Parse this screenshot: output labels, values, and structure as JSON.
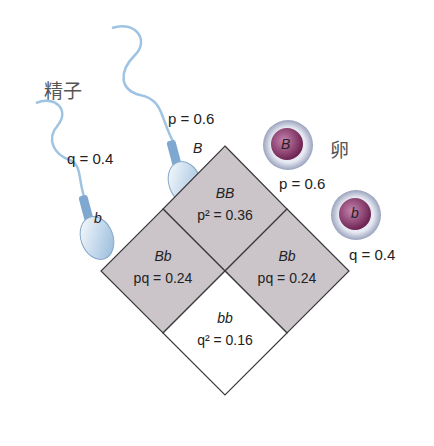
{
  "labels": {
    "sperm_title": "精子",
    "egg_title": "卵"
  },
  "sperm": [
    {
      "allele": "B",
      "freq_label": "p = 0.6"
    },
    {
      "allele": "b",
      "freq_label": "q = 0.4"
    }
  ],
  "eggs": [
    {
      "allele": "B",
      "freq_label": "p = 0.6"
    },
    {
      "allele": "b",
      "freq_label": "q = 0.4"
    }
  ],
  "punnett": {
    "top": {
      "genotype": "BB",
      "freq": "p² = 0.36"
    },
    "left": {
      "genotype": "Bb",
      "freq": "pq = 0.24"
    },
    "right": {
      "genotype": "Bb",
      "freq": "pq = 0.24"
    },
    "bottom": {
      "genotype": "bb",
      "freq": "q² = 0.16"
    }
  },
  "colors": {
    "shaded": "#c9c3c8",
    "border": "#3a3a3a",
    "sperm": "#a9cbe6",
    "egg_core": "#8e3f6e"
  }
}
